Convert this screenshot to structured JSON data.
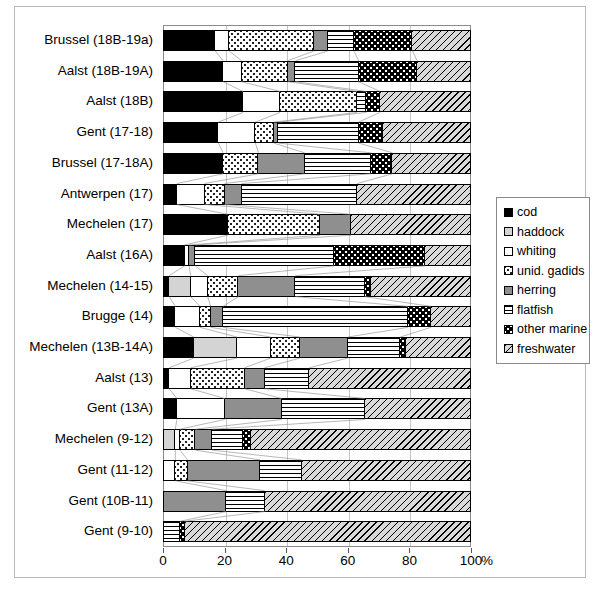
{
  "chart_data": {
    "type": "bar",
    "orientation": "horizontal",
    "stacked": true,
    "title": "",
    "xlabel": "%",
    "ylabel": "",
    "xlim": [
      0,
      100
    ],
    "xticks": [
      0,
      20,
      40,
      60,
      80,
      100
    ],
    "xticklabels": [
      "0",
      "20",
      "40",
      "60",
      "80",
      "100"
    ],
    "grid": true,
    "legend_position": "right",
    "categories": [
      "Brussel (18B-19a)",
      "Aalst (18B-19A)",
      "Aalst (18B)",
      "Gent (17-18)",
      "Brussel (17-18A)",
      "Antwerpen (17)",
      "Mechelen (17)",
      "Aalst (16A)",
      "Mechelen (14-15)",
      "Brugge (14)",
      "Mechelen (13B-14A)",
      "Aalst (13)",
      "Gent (13A)",
      "Mechelen (9-12)",
      "Gent (11-12)",
      "Gent (10B-11)",
      "Gent (9-10)"
    ],
    "series": [
      {
        "name": "cod",
        "fill": "f-cod",
        "swatch": "f-cod",
        "values": [
          17.0,
          19.5,
          26.0,
          18.0,
          19.5,
          4.5,
          21.0,
          7.0,
          2.0,
          4.0,
          10.0,
          2.0,
          4.5,
          0.0,
          0.0,
          0.0,
          0.0
        ]
      },
      {
        "name": "haddock",
        "fill": "f-haddock",
        "swatch": "f-haddock",
        "values": [
          0.0,
          0.0,
          0.0,
          0.0,
          0.0,
          0.0,
          0.0,
          0.0,
          7.0,
          0.0,
          14.0,
          0.0,
          0.0,
          4.0,
          0.0,
          0.0,
          0.0
        ]
      },
      {
        "name": "whiting",
        "fill": "f-whiting",
        "swatch": "f-whiting",
        "values": [
          4.5,
          6.0,
          12.0,
          12.0,
          0.0,
          9.0,
          0.0,
          1.5,
          5.5,
          8.0,
          11.0,
          7.0,
          15.5,
          1.5,
          4.0,
          0.0,
          0.0
        ]
      },
      {
        "name": "unid. gadids",
        "fill": "f-gadids",
        "swatch": "f-gadids",
        "values": [
          27.5,
          15.0,
          25.0,
          6.0,
          11.5,
          6.5,
          30.0,
          0.0,
          10.0,
          3.5,
          9.5,
          17.5,
          0.0,
          5.0,
          4.0,
          0.0,
          0.0
        ]
      },
      {
        "name": "herring",
        "fill": "f-herring",
        "swatch": "f-herring",
        "values": [
          4.5,
          2.5,
          0.0,
          1.5,
          15.0,
          5.5,
          10.0,
          2.0,
          18.5,
          4.0,
          15.5,
          6.5,
          18.5,
          5.5,
          23.5,
          20.5,
          0.0
        ]
      },
      {
        "name": "flatfish",
        "fill": "f-flatfish",
        "swatch": "f-flatfish",
        "values": [
          8.5,
          20.5,
          3.0,
          26.0,
          21.5,
          37.5,
          0.0,
          45.0,
          22.5,
          60.0,
          17.0,
          14.5,
          27.0,
          10.0,
          13.5,
          12.5,
          5.5
        ]
      },
      {
        "name": "other marine",
        "fill": "f-othermarine",
        "swatch": "f-othermarine",
        "values": [
          19.0,
          19.0,
          4.5,
          8.0,
          7.0,
          0.0,
          0.0,
          29.5,
          2.0,
          7.5,
          2.0,
          0.0,
          0.0,
          2.5,
          0.0,
          0.0,
          1.5
        ]
      },
      {
        "name": "freshwater",
        "fill": "f-freshwater",
        "swatch": "f-freshwater",
        "values": [
          19.0,
          17.5,
          29.5,
          28.5,
          25.5,
          37.0,
          39.0,
          15.0,
          32.5,
          13.0,
          21.0,
          52.5,
          34.5,
          71.5,
          55.0,
          67.0,
          93.0
        ]
      }
    ]
  },
  "axis": {
    "x_unit_label": "%"
  },
  "legend": {
    "items": [
      {
        "label": "cod"
      },
      {
        "label": "haddock"
      },
      {
        "label": "whiting"
      },
      {
        "label": "unid. gadids"
      },
      {
        "label": "herring"
      },
      {
        "label": "flatfish"
      },
      {
        "label": "other marine"
      },
      {
        "label": "freshwater"
      }
    ]
  },
  "colors": {
    "cod": "#000000",
    "haddock": "#d4d4d4",
    "whiting": "#ffffff",
    "unid_gadids": "#ffffff",
    "herring": "#8f8f8f",
    "flatfish": "#ffffff",
    "other_marine": "#000000",
    "freshwater": "#d9d9d9",
    "frame": "#8a8a8a",
    "grid": "#c4c4c4"
  }
}
